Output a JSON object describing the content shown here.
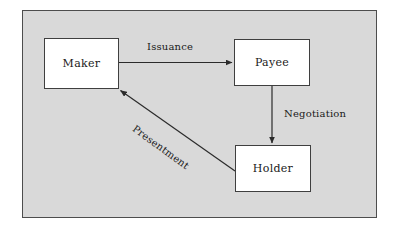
{
  "diagram": {
    "background_color": "#d9d9d9",
    "border_color": "#4d4d4d",
    "node_fill_color": "#ffffff",
    "line_color": "#333333",
    "nodes": [
      {
        "id": "maker",
        "label": "Maker"
      },
      {
        "id": "payee",
        "label": "Payee"
      },
      {
        "id": "holder",
        "label": "Holder"
      }
    ],
    "edges": [
      {
        "id": "issuance",
        "label": "Issuance",
        "from": "maker",
        "to": "payee",
        "direction": "right"
      },
      {
        "id": "negotiation",
        "label": "Negotiation",
        "from": "payee",
        "to": "holder",
        "direction": "down"
      },
      {
        "id": "presentment",
        "label": "Presentment",
        "from": "holder",
        "to": "maker",
        "direction": "diagonal-up-left"
      }
    ]
  }
}
